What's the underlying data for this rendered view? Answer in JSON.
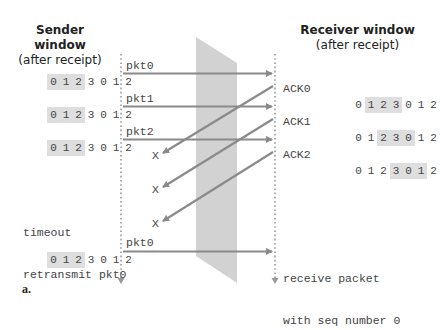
{
  "sender": {
    "title": "Sender window",
    "subtitle": "(after receipt)",
    "timeout_line1": "timeout",
    "timeout_line2": "retransmit pkt0",
    "windows": [
      {
        "seq": [
          "0",
          "1",
          "2",
          "3",
          "0",
          "1",
          "2"
        ],
        "window_start": 0,
        "window_size": 3
      },
      {
        "seq": [
          "0",
          "1",
          "2",
          "3",
          "0",
          "1",
          "2"
        ],
        "window_start": 0,
        "window_size": 3
      },
      {
        "seq": [
          "0",
          "1",
          "2",
          "3",
          "0",
          "1",
          "2"
        ],
        "window_start": 0,
        "window_size": 3
      },
      {
        "seq": [
          "0",
          "1",
          "2",
          "3",
          "0",
          "1",
          "2"
        ],
        "window_start": 0,
        "window_size": 3
      }
    ]
  },
  "receiver": {
    "title": "Receiver window",
    "subtitle": "(after receipt)",
    "receive_line1": "receive packet",
    "receive_line2": "with seq number 0",
    "windows": [
      {
        "ack": "ACK0",
        "seq": [
          "0",
          "1",
          "2",
          "3",
          "0",
          "1",
          "2"
        ],
        "window_start": 1,
        "window_size": 3
      },
      {
        "ack": "ACK1",
        "seq": [
          "0",
          "1",
          "2",
          "3",
          "0",
          "1",
          "2"
        ],
        "window_start": 2,
        "window_size": 3
      },
      {
        "ack": "ACK2",
        "seq": [
          "0",
          "1",
          "2",
          "3",
          "0",
          "1",
          "2"
        ],
        "window_start": 3,
        "window_size": 3
      }
    ]
  },
  "packets": [
    "pkt0",
    "pkt1",
    "pkt2",
    "pkt0"
  ],
  "lost_marker": "X",
  "caption": "a.",
  "colors": {
    "arrow": "#8a8a8a",
    "channel": "#cfcfcf",
    "window_highlight": "#dedede",
    "timeline_dots": "#9a9a9a"
  }
}
